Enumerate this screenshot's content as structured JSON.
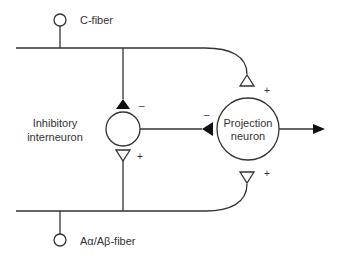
{
  "diagram": {
    "type": "neural circuit (gate control)",
    "labels": {
      "c_fiber": "C-fiber",
      "a_fiber": "Aα/Aβ-fiber",
      "inhibitory_line1": "Inhibitory",
      "inhibitory_line2": "interneuron",
      "projection_line1": "Projection",
      "projection_line2": "neuron"
    },
    "signs": {
      "c_to_inhibitory": "–",
      "inhibitory_to_projection": "–",
      "c_to_projection": "+",
      "a_to_inhibitory": "+",
      "a_to_projection": "+"
    },
    "colors": {
      "line": "#333333",
      "excitatory_synapse_fill": "#ffffff",
      "inhibitory_synapse_fill": "#111111"
    }
  }
}
